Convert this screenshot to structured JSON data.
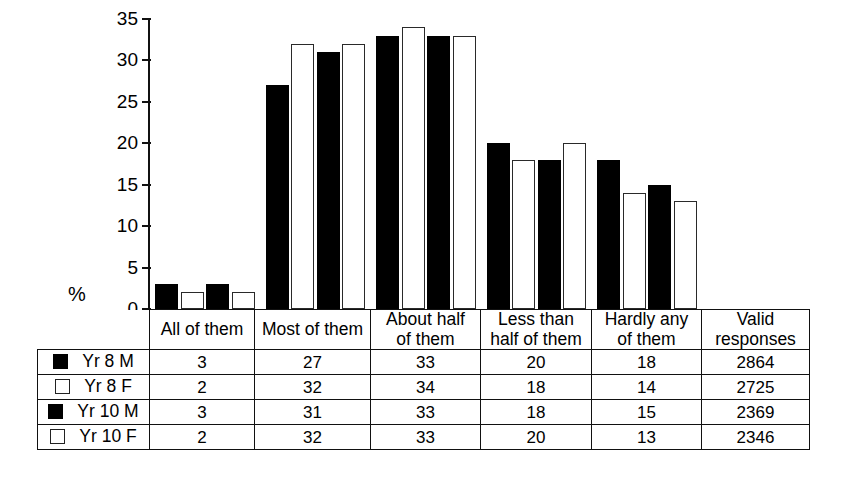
{
  "chart_data": {
    "type": "bar",
    "title": "",
    "xlabel": "",
    "ylabel": "%",
    "ylim": [
      0,
      35
    ],
    "yticks": [
      0,
      5,
      10,
      15,
      20,
      25,
      30,
      35
    ],
    "grid": false,
    "legend_position": "table-left-column",
    "categories": [
      "All of them",
      "Most of them",
      "About half of them",
      "Less than half of them",
      "Hardly any of them"
    ],
    "series": [
      {
        "name": "Yr 8 M",
        "marker": "filled-square",
        "values": [
          3,
          27,
          33,
          20,
          18
        ],
        "valid_responses": 2864
      },
      {
        "name": "Yr 8 F",
        "marker": "open-square",
        "values": [
          2,
          32,
          34,
          18,
          14
        ],
        "valid_responses": 2725
      },
      {
        "name": "Yr 10 M",
        "marker": "filled-square",
        "values": [
          3,
          31,
          33,
          18,
          15
        ],
        "valid_responses": 2369
      },
      {
        "name": "Yr 10 F",
        "marker": "open-square",
        "values": [
          2,
          32,
          33,
          20,
          13
        ],
        "valid_responses": 2346
      }
    ]
  },
  "axis": {
    "y_label": "%",
    "ticks": [
      "35",
      "30",
      "25",
      "20",
      "15",
      "10",
      "5",
      "0"
    ]
  },
  "table": {
    "headers": [
      {
        "line1": "All of them",
        "line2": ""
      },
      {
        "line1": "Most of them",
        "line2": ""
      },
      {
        "line1": "About half",
        "line2": "of them"
      },
      {
        "line1": "Less than",
        "line2": "half of them"
      },
      {
        "line1": "Hardly any",
        "line2": "of them"
      },
      {
        "line1": "Valid",
        "line2": "responses"
      }
    ],
    "rows": [
      {
        "label": "Yr 8 M",
        "marker": "filled",
        "cells": [
          "3",
          "27",
          "33",
          "20",
          "18",
          "2864"
        ]
      },
      {
        "label": "Yr 8 F",
        "marker": "open",
        "cells": [
          "2",
          "32",
          "34",
          "18",
          "14",
          "2725"
        ]
      },
      {
        "label": "Yr 10 M",
        "marker": "filled",
        "cells": [
          "3",
          "31",
          "33",
          "18",
          "15",
          "2369"
        ]
      },
      {
        "label": "Yr 10 F",
        "marker": "open",
        "cells": [
          "2",
          "32",
          "33",
          "20",
          "13",
          "2346"
        ]
      }
    ]
  }
}
